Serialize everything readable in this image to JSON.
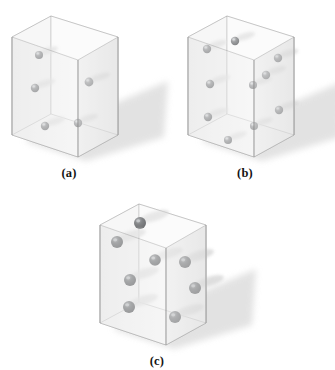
{
  "figure": {
    "background_color": "#ffffff",
    "panel_count": 3
  },
  "style": {
    "box_edge_color": "#9a9a9a",
    "box_face_left": "#eeeeee",
    "box_face_right": "#e6e6e6",
    "box_face_floor": "#f7f7f7",
    "box_face_back": "#f3f3f3",
    "sphere_color_light": "#6d6f72",
    "sphere_color_dark": "#3c3e41",
    "sphere_highlight": "#c9cbce",
    "shadow_color": "#d9d9d9",
    "label_color": "#141414"
  },
  "panels": [
    {
      "id": "panel-a",
      "label": "(a)",
      "description": "Low particle density box",
      "particle_count": 5,
      "particle_radius": 4.0,
      "particle_shade": "light",
      "origin": {
        "x": 4,
        "y": 8
      },
      "box": {
        "top_back_left": {
          "x": 8,
          "y": 29
        },
        "top_back_apex": {
          "x": 47,
          "y": 8
        },
        "top_front_right": {
          "x": 114,
          "y": 29
        },
        "top_front_center": {
          "x": 74,
          "y": 52
        },
        "bot_back_left": {
          "x": 8,
          "y": 127
        },
        "bot_front_center": {
          "x": 74,
          "y": 149
        },
        "bot_front_right": {
          "x": 114,
          "y": 127
        }
      },
      "particles": [
        {
          "x": 35,
          "y": 47,
          "face": "back-left",
          "r": 4.0
        },
        {
          "x": 31,
          "y": 80,
          "face": "back-left",
          "r": 4.2
        },
        {
          "x": 85,
          "y": 74,
          "face": "front-right",
          "r": 4.4
        },
        {
          "x": 41,
          "y": 118,
          "face": "floor",
          "r": 4.2
        },
        {
          "x": 74,
          "y": 115,
          "face": "floor",
          "r": 4.2
        }
      ],
      "label_position": {
        "x": 0,
        "y": 158
      }
    },
    {
      "id": "panel-b",
      "label": "(b)",
      "description": "Medium particle density box",
      "particle_count": 10,
      "particle_radius": 4.0,
      "particle_shade": "light",
      "origin": {
        "x": 180,
        "y": 8
      },
      "box": {
        "top_back_left": {
          "x": 8,
          "y": 29
        },
        "top_back_apex": {
          "x": 47,
          "y": 8
        },
        "top_front_right": {
          "x": 114,
          "y": 29
        },
        "top_front_center": {
          "x": 74,
          "y": 52
        },
        "bot_back_left": {
          "x": 8,
          "y": 127
        },
        "bot_front_center": {
          "x": 74,
          "y": 149
        },
        "bot_front_right": {
          "x": 114,
          "y": 127
        }
      },
      "particles": [
        {
          "x": 55,
          "y": 33,
          "face": "back",
          "r": 4.2
        },
        {
          "x": 27,
          "y": 41,
          "face": "back-left",
          "r": 4.2
        },
        {
          "x": 98,
          "y": 50,
          "face": "front-right",
          "r": 4.2
        },
        {
          "x": 30,
          "y": 76,
          "face": "back-left",
          "r": 4.2
        },
        {
          "x": 73,
          "y": 77,
          "face": "interior",
          "r": 4.0
        },
        {
          "x": 86,
          "y": 67,
          "face": "front-right",
          "r": 4.2
        },
        {
          "x": 28,
          "y": 109,
          "face": "back-left",
          "r": 4.2
        },
        {
          "x": 99,
          "y": 102,
          "face": "front-right",
          "r": 4.2
        },
        {
          "x": 74,
          "y": 118,
          "face": "floor",
          "r": 4.0
        },
        {
          "x": 48,
          "y": 132,
          "face": "floor",
          "r": 4.0
        }
      ],
      "label_position": {
        "x": 0,
        "y": 158
      }
    },
    {
      "id": "panel-c",
      "label": "(c)",
      "description": "Box with larger darker particles",
      "particle_count": 8,
      "particle_radius": 6.0,
      "particle_shade": "dark",
      "origin": {
        "x": 92,
        "y": 196
      },
      "box": {
        "top_back_left": {
          "x": 8,
          "y": 29
        },
        "top_back_apex": {
          "x": 47,
          "y": 8
        },
        "top_front_right": {
          "x": 114,
          "y": 29
        },
        "top_front_center": {
          "x": 74,
          "y": 52
        },
        "bot_back_left": {
          "x": 8,
          "y": 127
        },
        "bot_front_center": {
          "x": 74,
          "y": 149
        },
        "bot_front_right": {
          "x": 114,
          "y": 127
        }
      },
      "particles": [
        {
          "x": 48,
          "y": 27,
          "face": "back",
          "r": 6.0
        },
        {
          "x": 25,
          "y": 46,
          "face": "back-left",
          "r": 6.0
        },
        {
          "x": 63,
          "y": 64,
          "face": "interior",
          "r": 5.8
        },
        {
          "x": 93,
          "y": 66,
          "face": "front-right",
          "r": 6.0
        },
        {
          "x": 38,
          "y": 84,
          "face": "back-left",
          "r": 6.0
        },
        {
          "x": 103,
          "y": 92,
          "face": "front-right",
          "r": 6.0
        },
        {
          "x": 37,
          "y": 111,
          "face": "back-left",
          "r": 6.0
        },
        {
          "x": 83,
          "y": 121,
          "face": "floor",
          "r": 6.0
        }
      ],
      "label_position": {
        "x": 0,
        "y": 158
      }
    }
  ]
}
